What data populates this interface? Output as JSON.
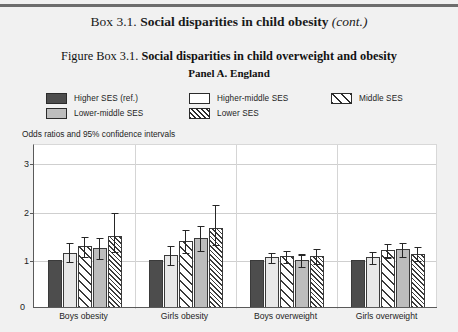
{
  "box": {
    "label": "Box 3.1.",
    "title": "Social disparities in child obesity",
    "cont": "(cont.)"
  },
  "figure": {
    "label": "Figure Box 3.1.",
    "title": "Social disparities in child overweight and obesity",
    "panel": "Panel A. England",
    "axis_note": "Odds ratios and 95% confidence intervals"
  },
  "legend": {
    "items": [
      {
        "label": "Higher SES (ref.)",
        "swatch": "solid-dark-gray",
        "key": "higher"
      },
      {
        "label": "Higher-middle SES",
        "swatch": "white-outline",
        "key": "highermid"
      },
      {
        "label": "Middle SES",
        "swatch": "sparse-hatch",
        "key": "middle"
      },
      {
        "label": "Lower-middle SES",
        "swatch": "solid-light-gray",
        "key": "lowermid"
      },
      {
        "label": "Lower SES",
        "swatch": "dense-hatch",
        "key": "lower"
      }
    ]
  },
  "chart_data": {
    "type": "bar",
    "title": "Social disparities in child overweight and obesity",
    "subtitle": "Panel A. England",
    "xlabel": "",
    "ylabel": "Odds ratios and 95% confidence intervals",
    "ylim": [
      0,
      3.4
    ],
    "yticks": [
      0,
      1,
      2,
      3
    ],
    "ytick_labels": [
      "0",
      "1",
      "2",
      "3"
    ],
    "grid": true,
    "legend_position": "top",
    "reference_line": 1,
    "categories": [
      "Boys obesity",
      "Girls obesity",
      "Boys overweight",
      "Girls overweight"
    ],
    "series": [
      {
        "name": "Higher SES (ref.)",
        "style": "solid-dark-gray",
        "values": [
          1.0,
          1.0,
          1.0,
          1.0
        ],
        "ci_low": [
          null,
          null,
          null,
          null
        ],
        "ci_high": [
          null,
          null,
          null,
          null
        ]
      },
      {
        "name": "Higher-middle SES",
        "style": "white-outline",
        "values": [
          1.15,
          1.09,
          1.05,
          1.05
        ],
        "ci_low": [
          0.98,
          0.91,
          0.95,
          0.93
        ],
        "ci_high": [
          1.37,
          1.3,
          1.17,
          1.18
        ]
      },
      {
        "name": "Middle SES",
        "style": "sparse-hatch",
        "values": [
          1.28,
          1.38,
          1.07,
          1.2
        ],
        "ci_low": [
          1.08,
          1.16,
          0.96,
          1.07
        ],
        "ci_high": [
          1.5,
          1.64,
          1.2,
          1.35
        ]
      },
      {
        "name": "Lower-middle SES",
        "style": "solid-light-gray",
        "values": [
          1.25,
          1.45,
          1.0,
          1.22
        ],
        "ci_low": [
          1.04,
          1.2,
          0.88,
          1.08
        ],
        "ci_high": [
          1.47,
          1.72,
          1.13,
          1.37
        ]
      },
      {
        "name": "Lower SES",
        "style": "dense-hatch",
        "values": [
          1.5,
          1.65,
          1.08,
          1.12
        ],
        "ci_low": [
          1.19,
          1.33,
          0.94,
          0.99
        ],
        "ci_high": [
          2.0,
          2.15,
          1.25,
          1.28
        ]
      }
    ]
  }
}
